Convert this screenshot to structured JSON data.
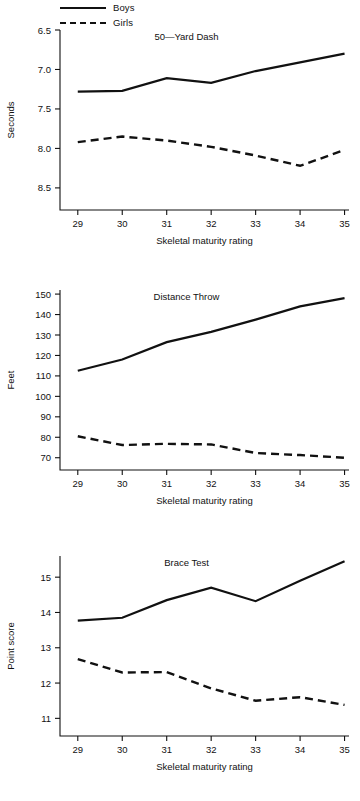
{
  "legend": {
    "entries": [
      {
        "label": "Boys",
        "style": "solid"
      },
      {
        "label": "Girls",
        "style": "dashed"
      }
    ]
  },
  "common": {
    "xlabel": "Skeletal maturity rating",
    "xticks": [
      "29",
      "30",
      "31",
      "32",
      "33",
      "34",
      "35"
    ]
  },
  "chart_data": [
    {
      "type": "line",
      "title": "50—Yard Dash",
      "xlabel": "Skeletal maturity rating",
      "ylabel": "Seconds",
      "x": [
        29,
        30,
        31,
        32,
        33,
        34,
        35
      ],
      "xticklabels": [
        "29",
        "30",
        "31",
        "32",
        "33",
        "34",
        "35"
      ],
      "yticks": [
        6.5,
        7.0,
        7.5,
        8.0,
        8.5
      ],
      "yticklabels": [
        "6.5",
        "7.0",
        "7.5",
        "8.0",
        "8.5"
      ],
      "ylim": [
        6.5,
        8.78
      ],
      "xlim": [
        28.6,
        35.1
      ],
      "y_inverted": true,
      "grid": false,
      "legend_position": "above-left",
      "series": [
        {
          "name": "Boys",
          "style": "solid",
          "values": [
            7.28,
            7.27,
            7.11,
            7.17,
            7.02,
            6.91,
            6.8
          ]
        },
        {
          "name": "Girls",
          "style": "dashed",
          "values": [
            7.92,
            7.85,
            7.9,
            7.98,
            8.09,
            8.22,
            8.02
          ]
        }
      ]
    },
    {
      "type": "line",
      "title": "Distance Throw",
      "xlabel": "Skeletal maturity rating",
      "ylabel": "Feet",
      "x": [
        29,
        30,
        31,
        32,
        33,
        34,
        35
      ],
      "xticklabels": [
        "29",
        "30",
        "31",
        "32",
        "33",
        "34",
        "35"
      ],
      "yticks": [
        70,
        80,
        90,
        100,
        110,
        120,
        130,
        140,
        150
      ],
      "yticklabels": [
        "70",
        "80",
        "90",
        "100",
        "110",
        "120",
        "130",
        "140",
        "150"
      ],
      "ylim": [
        64,
        152
      ],
      "xlim": [
        28.6,
        35.1
      ],
      "y_inverted": false,
      "grid": false,
      "legend_position": "none",
      "series": [
        {
          "name": "Boys",
          "style": "solid",
          "values": [
            112.5,
            118.0,
            126.5,
            131.5,
            137.5,
            144.0,
            148.0
          ]
        },
        {
          "name": "Girls",
          "style": "dashed",
          "values": [
            80.5,
            76.2,
            76.8,
            76.5,
            72.3,
            71.3,
            70.0
          ]
        }
      ]
    },
    {
      "type": "line",
      "title": "Brace Test",
      "xlabel": "Skeletal maturity rating",
      "ylabel": "Point score",
      "x": [
        29,
        30,
        31,
        32,
        33,
        34,
        35
      ],
      "xticklabels": [
        "29",
        "30",
        "31",
        "32",
        "33",
        "34",
        "35"
      ],
      "yticks": [
        11,
        12,
        13,
        14,
        15
      ],
      "yticklabels": [
        "11",
        "12",
        "13",
        "14",
        "15"
      ],
      "ylim": [
        10.5,
        15.6
      ],
      "xlim": [
        28.6,
        35.1
      ],
      "y_inverted": false,
      "grid": false,
      "legend_position": "none",
      "series": [
        {
          "name": "Boys",
          "style": "solid",
          "values": [
            13.77,
            13.85,
            14.35,
            14.7,
            14.32,
            14.9,
            15.45
          ]
        },
        {
          "name": "Girls",
          "style": "dashed",
          "values": [
            12.68,
            12.3,
            12.31,
            11.85,
            11.5,
            11.6,
            11.38
          ]
        }
      ]
    }
  ]
}
